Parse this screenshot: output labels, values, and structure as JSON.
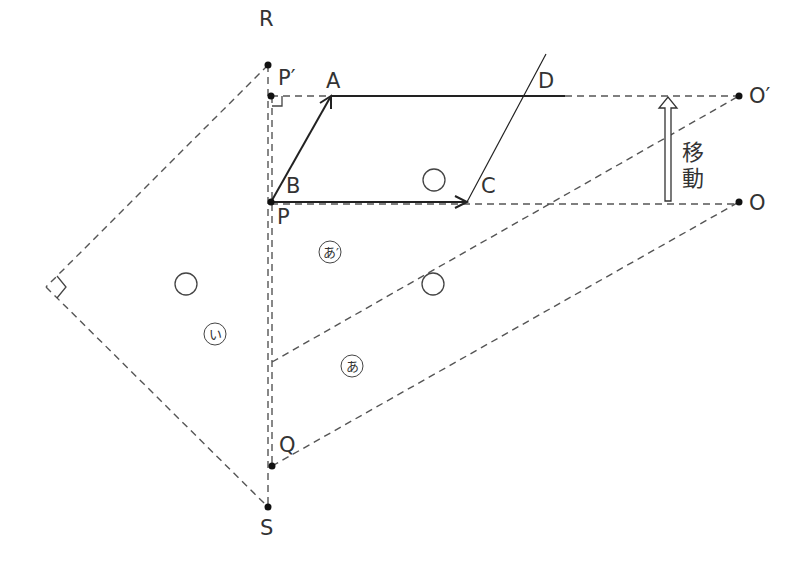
{
  "diagram": {
    "points": {
      "R": "R",
      "P_prime": "P′",
      "A": "A",
      "D": "D",
      "O_prime": "O′",
      "B": "B",
      "P": "P",
      "C": "C",
      "O": "O",
      "Q": "Q",
      "S": "S"
    },
    "move_label_1": "移",
    "move_label_2": "動",
    "region_a_prime": "あ′",
    "region_a": "あ",
    "region_i": "い",
    "circle_mark": "○",
    "colors": {
      "line": "#222222",
      "dashed": "#555555",
      "text": "#333333"
    }
  }
}
